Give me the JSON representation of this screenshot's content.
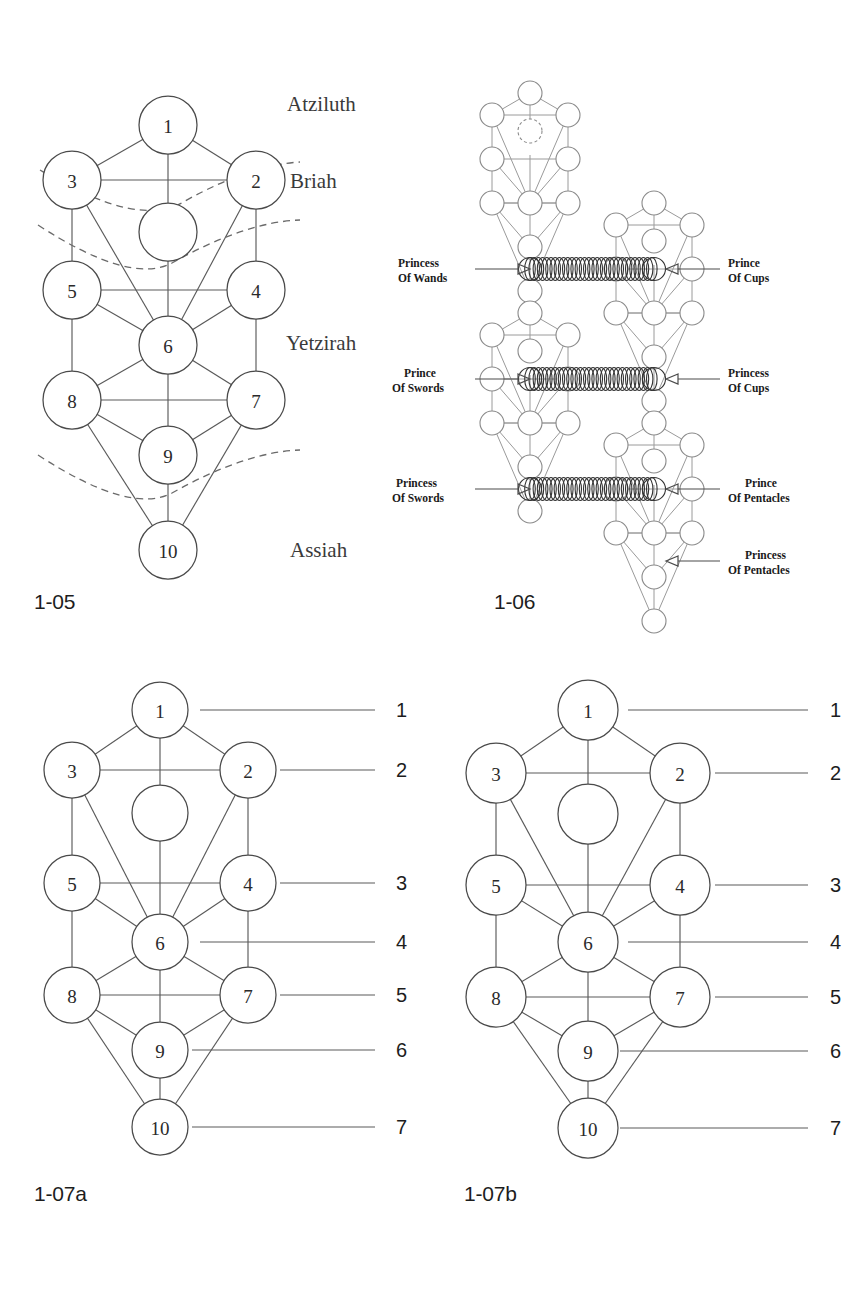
{
  "page": {
    "background": "#ffffff",
    "ink": "#2a2a2a"
  },
  "figures": [
    {
      "id": "fig-1-05",
      "caption": "1-05",
      "type": "tree-of-life-four-worlds",
      "node_labels": [
        "1",
        "2",
        "3",
        "4",
        "5",
        "6",
        "7",
        "8",
        "9",
        "10"
      ],
      "hidden_node_label": "",
      "world_labels": [
        "Atziluth",
        "Briah",
        "Yetzirah",
        "Assiah"
      ],
      "veil_count": 3
    },
    {
      "id": "fig-1-06",
      "caption": "1-06",
      "type": "interlocking-trees",
      "tree_count": 4,
      "court_labels_left": [
        {
          "line1": "Princess",
          "line2": "Of Wands"
        },
        {
          "line1": "Prince",
          "line2": "Of Swords"
        },
        {
          "line1": "Princess",
          "line2": "Of Swords"
        }
      ],
      "court_labels_right": [
        {
          "line1": "Prince",
          "line2": "Of Cups"
        },
        {
          "line1": "Princess",
          "line2": "Of Cups"
        },
        {
          "line1": "Prince",
          "line2": "Of Pentacles"
        },
        {
          "line1": "Princess",
          "line2": "Of Pentacles"
        }
      ]
    },
    {
      "id": "fig-1-07a",
      "caption": "1-07a",
      "type": "tree-of-life-levels",
      "node_labels": [
        "1",
        "2",
        "3",
        "4",
        "5",
        "6",
        "7",
        "8",
        "9",
        "10"
      ],
      "level_numbers": [
        "1",
        "2",
        "3",
        "4",
        "5",
        "6",
        "7"
      ]
    },
    {
      "id": "fig-1-07b",
      "caption": "1-07b",
      "type": "tree-of-life-levels",
      "node_labels": [
        "1",
        "2",
        "3",
        "4",
        "5",
        "6",
        "7",
        "8",
        "9",
        "10"
      ],
      "level_numbers": [
        "1",
        "2",
        "3",
        "4",
        "5",
        "6",
        "7"
      ]
    }
  ],
  "fig105": {
    "caption": "1-05",
    "nodes": {
      "n1": "1",
      "n2": "2",
      "n3": "3",
      "n4": "4",
      "n5": "5",
      "n6": "6",
      "n7": "7",
      "n8": "8",
      "n9": "9",
      "n10": "10"
    },
    "worlds": {
      "atziluth": "Atziluth",
      "briah": "Briah",
      "yetzirah": "Yetzirah",
      "assiah": "Assiah"
    }
  },
  "fig106": {
    "caption": "1-06",
    "labels": {
      "princess_of_wands_1": "Princess",
      "princess_of_wands_2": "Of Wands",
      "prince_of_cups_1": "Prince",
      "prince_of_cups_2": "Of Cups",
      "prince_of_swords_1": "Prince",
      "prince_of_swords_2": "Of Swords",
      "princess_of_cups_1": "Princess",
      "princess_of_cups_2": "Of Cups",
      "princess_of_swords_1": "Princess",
      "princess_of_swords_2": "Of Swords",
      "prince_of_pentacles_1": "Prince",
      "prince_of_pentacles_2": "Of Pentacles",
      "princess_of_pentacles_1": "Princess",
      "princess_of_pentacles_2": "Of Pentacles"
    }
  },
  "fig107a": {
    "caption": "1-07a",
    "nodes": {
      "n1": "1",
      "n2": "2",
      "n3": "3",
      "n4": "4",
      "n5": "5",
      "n6": "6",
      "n7": "7",
      "n8": "8",
      "n9": "9",
      "n10": "10"
    },
    "levels": {
      "l1": "1",
      "l2": "2",
      "l3": "3",
      "l4": "4",
      "l5": "5",
      "l6": "6",
      "l7": "7"
    }
  },
  "fig107b": {
    "caption": "1-07b",
    "nodes": {
      "n1": "1",
      "n2": "2",
      "n3": "3",
      "n4": "4",
      "n5": "5",
      "n6": "6",
      "n7": "7",
      "n8": "8",
      "n9": "9",
      "n10": "10"
    },
    "levels": {
      "l1": "1",
      "l2": "2",
      "l3": "3",
      "l4": "4",
      "l5": "5",
      "l6": "6",
      "l7": "7"
    }
  }
}
